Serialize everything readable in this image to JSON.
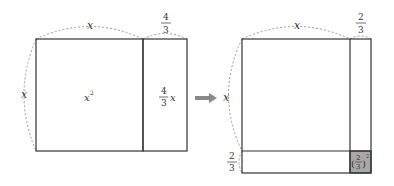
{
  "left_figure": {
    "top_label": "x",
    "side_label": "x",
    "strip_top_num": "4",
    "strip_top_den": "3",
    "square_label": "x",
    "square_exp": "2",
    "strip_num": "4",
    "strip_den": "3",
    "strip_var": "x"
  },
  "right_figure": {
    "top_label": "x",
    "side_label": "x",
    "strip_top_num": "2",
    "strip_top_den": "3",
    "bottom_side_num": "2",
    "bottom_side_den": "3",
    "corner_num": "2",
    "corner_den": "3",
    "corner_exp": "2"
  },
  "colors": {
    "corner_fill": "#a8a8a8",
    "arrow": "#888888",
    "line": "#333333",
    "dashed": "#999999"
  }
}
